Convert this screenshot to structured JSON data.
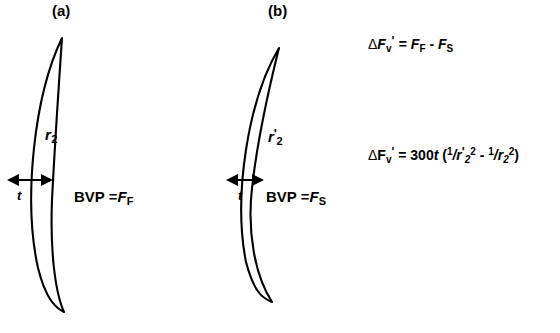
{
  "figure": {
    "background_color": "#ffffff",
    "stroke_color": "#000000",
    "width": 560,
    "height": 333
  },
  "panels": [
    {
      "id": "a",
      "title": "(a)",
      "radius_label": {
        "symbol": "r",
        "prime": "",
        "subscript": "2"
      },
      "thickness_label": "t",
      "bvp_label": {
        "text": "BVP =",
        "symbol": "F",
        "subscript": "F"
      },
      "lens_description": "thin-crescent-lens"
    },
    {
      "id": "b",
      "title": "(b)",
      "radius_label": {
        "symbol": "r",
        "prime": "'",
        "subscript": "2"
      },
      "thickness_label": "t",
      "bvp_label": {
        "text": "BVP =",
        "symbol": "F",
        "subscript": "S"
      },
      "lens_description": "thick-crescent-lens"
    }
  ],
  "equations": [
    {
      "id": "delta-fv-definition",
      "plain_text": "ΔFv' = FF - FS",
      "parts": {
        "delta": "Δ",
        "f": "F",
        "sub_v": "v",
        "prime": "'",
        "equals": "=",
        "term1": "F",
        "term1_sub": "F",
        "minus": "-",
        "term2": "F",
        "term2_sub": "S"
      }
    },
    {
      "id": "delta-fv-formula",
      "plain_text": "ΔFv' = 300t (1/r'2^2 - 1/r2^2)",
      "parts": {
        "delta": "Δ",
        "f": "F",
        "sub_v": "v",
        "prime": "'",
        "equals": "=",
        "coefficient": "300",
        "thickness": "t",
        "open_paren": "(",
        "num1": "1",
        "slash1": "/",
        "denom1": "r",
        "denom1_prime": "'",
        "denom1_sub": "2",
        "denom1_sup": "2",
        "minus": "-",
        "num2": "1",
        "slash2": "/",
        "denom2": "r",
        "denom2_sub": "2",
        "denom2_sup": "2",
        "close_paren": ")"
      }
    }
  ]
}
